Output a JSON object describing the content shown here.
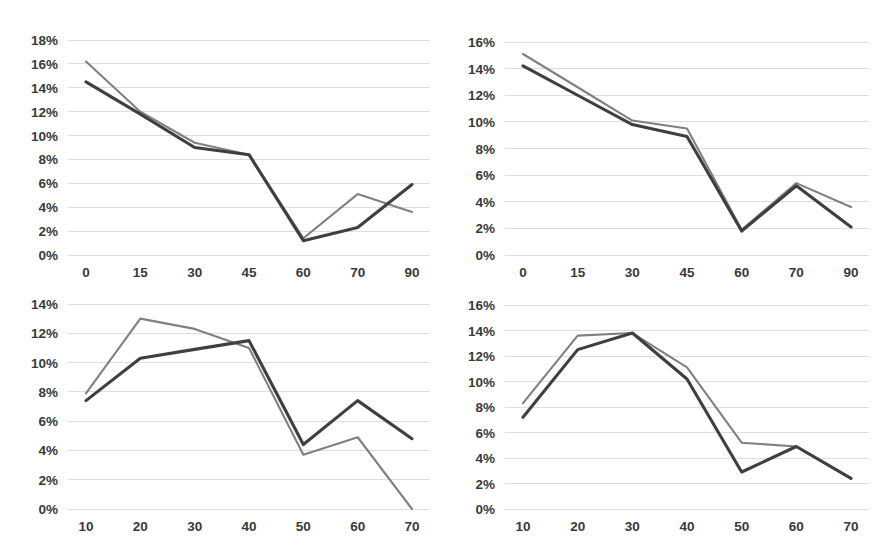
{
  "page": {
    "background_color": "#ffffff",
    "layout": "2x2 grid of line charts"
  },
  "style": {
    "series_a_color": "#808080",
    "series_b_color": "#3f3f3f",
    "gridline_color": "#dedede",
    "text_color": "#3a3a3a"
  },
  "chart_data": [
    {
      "id": "chart-top-left",
      "type": "line",
      "title": "",
      "xlabel": "",
      "ylabel": "",
      "grid": true,
      "legend": "none",
      "categories": [
        "0",
        "15",
        "30",
        "45",
        "60",
        "70",
        "90"
      ],
      "x_tick_labels": [
        "0",
        "15",
        "30",
        "45",
        "60",
        "70",
        "90"
      ],
      "y_tick_labels": [
        "0%",
        "2%",
        "4%",
        "6%",
        "8%",
        "10%",
        "12%",
        "14%",
        "16%",
        "18%"
      ],
      "y_ticks": [
        0,
        2,
        4,
        6,
        8,
        10,
        12,
        14,
        16,
        18
      ],
      "ylim": [
        0,
        18
      ],
      "series": [
        {
          "name": "series-a",
          "color": "#808080",
          "values": [
            16.2,
            12.0,
            9.4,
            8.4,
            1.4,
            5.1,
            3.6
          ]
        },
        {
          "name": "series-b",
          "color": "#3f3f3f",
          "values": [
            14.5,
            11.8,
            9.0,
            8.4,
            1.2,
            2.3,
            5.9
          ]
        }
      ]
    },
    {
      "id": "chart-top-right",
      "type": "line",
      "title": "",
      "xlabel": "",
      "ylabel": "",
      "grid": true,
      "legend": "none",
      "categories": [
        "0",
        "15",
        "30",
        "45",
        "60",
        "70",
        "90"
      ],
      "x_tick_labels": [
        "0",
        "15",
        "30",
        "45",
        "60",
        "70",
        "90"
      ],
      "y_tick_labels": [
        "0%",
        "2%",
        "4%",
        "6%",
        "8%",
        "10%",
        "12%",
        "14%",
        "16%"
      ],
      "y_ticks": [
        0,
        2,
        4,
        6,
        8,
        10,
        12,
        14,
        16
      ],
      "ylim": [
        0,
        16
      ],
      "series": [
        {
          "name": "series-a",
          "color": "#808080",
          "values": [
            15.1,
            12.6,
            10.1,
            9.5,
            1.9,
            5.4,
            3.6
          ]
        },
        {
          "name": "series-b",
          "color": "#3f3f3f",
          "values": [
            14.2,
            12.0,
            9.8,
            8.9,
            1.8,
            5.2,
            2.1
          ]
        }
      ]
    },
    {
      "id": "chart-bottom-left",
      "type": "line",
      "title": "",
      "xlabel": "",
      "ylabel": "",
      "grid": true,
      "legend": "none",
      "categories": [
        "10",
        "20",
        "30",
        "40",
        "50",
        "60",
        "70"
      ],
      "x_tick_labels": [
        "10",
        "20",
        "30",
        "40",
        "50",
        "60",
        "70"
      ],
      "y_tick_labels": [
        "0%",
        "2%",
        "4%",
        "6%",
        "8%",
        "10%",
        "12%",
        "14%"
      ],
      "y_ticks": [
        0,
        2,
        4,
        6,
        8,
        10,
        12,
        14
      ],
      "ylim": [
        0,
        14
      ],
      "series": [
        {
          "name": "series-a",
          "color": "#808080",
          "values": [
            7.9,
            13.0,
            12.3,
            11.0,
            3.7,
            4.9,
            0.0
          ]
        },
        {
          "name": "series-b",
          "color": "#3f3f3f",
          "values": [
            7.4,
            10.3,
            10.9,
            11.5,
            4.4,
            7.4,
            4.8
          ]
        }
      ]
    },
    {
      "id": "chart-bottom-right",
      "type": "line",
      "title": "",
      "xlabel": "",
      "ylabel": "",
      "grid": true,
      "legend": "none",
      "categories": [
        "10",
        "20",
        "30",
        "40",
        "50",
        "60",
        "70"
      ],
      "x_tick_labels": [
        "10",
        "20",
        "30",
        "40",
        "50",
        "60",
        "70"
      ],
      "y_tick_labels": [
        "0%",
        "2%",
        "4%",
        "6%",
        "8%",
        "10%",
        "12%",
        "14%",
        "16%"
      ],
      "y_ticks": [
        0,
        2,
        4,
        6,
        8,
        10,
        12,
        14,
        16
      ],
      "ylim": [
        0,
        16
      ],
      "series": [
        {
          "name": "series-a",
          "color": "#808080",
          "values": [
            8.3,
            13.6,
            13.8,
            11.1,
            5.2,
            4.9,
            2.4
          ]
        },
        {
          "name": "series-b",
          "color": "#3f3f3f",
          "values": [
            7.2,
            12.5,
            13.8,
            10.2,
            2.9,
            4.9,
            2.4
          ]
        }
      ]
    }
  ]
}
